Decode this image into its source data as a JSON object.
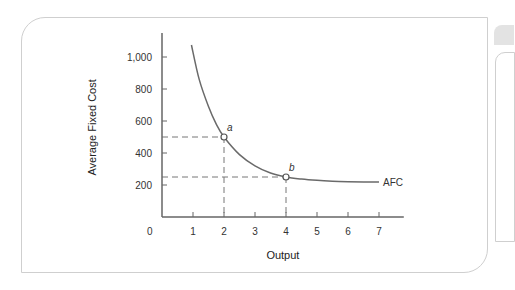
{
  "chart_data": {
    "type": "line",
    "title": "",
    "xlabel": "Output",
    "ylabel": "Average Fixed Cost",
    "xlim": [
      0,
      7.8
    ],
    "ylim": [
      0,
      1150
    ],
    "x_ticks": [
      1,
      2,
      3,
      4,
      5,
      6,
      7
    ],
    "x_tick_labels": [
      "1",
      "2",
      "3",
      "4",
      "5",
      "6",
      "7"
    ],
    "origin_label": "0",
    "y_ticks": [
      200,
      400,
      600,
      800,
      1000
    ],
    "y_tick_labels": [
      "200",
      "400",
      "600",
      "800",
      "1,000"
    ],
    "grid": false,
    "series": [
      {
        "name": "AFC",
        "x": [
          0.95,
          1.2,
          1.5,
          1.75,
          2,
          2.5,
          3,
          3.5,
          4,
          4.5,
          5,
          5.5,
          6,
          6.5,
          7
        ],
        "y": [
          1075,
          860,
          690,
          580,
          500,
          390,
          320,
          275,
          250,
          237,
          229,
          224,
          221,
          219,
          218
        ]
      }
    ],
    "points": [
      {
        "label": "a",
        "x": 2,
        "y": 500
      },
      {
        "label": "b",
        "x": 4,
        "y": 250
      }
    ],
    "annotations": [
      {
        "text": "AFC",
        "x": 7,
        "y": 218
      }
    ]
  }
}
